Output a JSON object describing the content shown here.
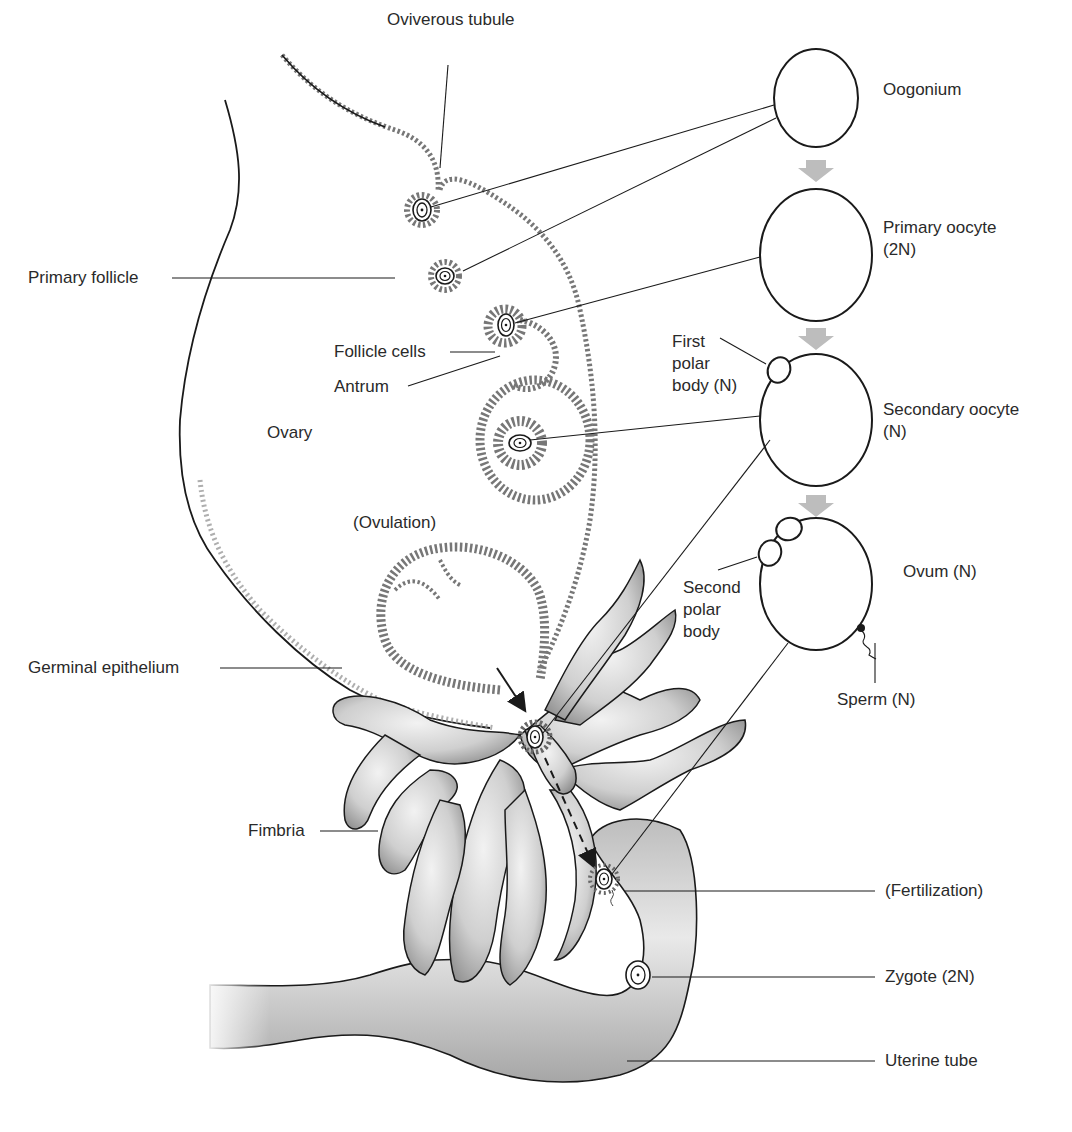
{
  "diagram": {
    "colors": {
      "line": "#1a1a1a",
      "tissue_fill": "#d4d4d4",
      "tissue_shade": "#a9a9a9",
      "arrow_gray": "#bdbdbd",
      "cell_outline": "#555555",
      "background": "#ffffff"
    }
  },
  "labels": {
    "oviverous_tubule": "Oviverous tubule",
    "primary_follicle": "Primary follicle",
    "follicle_cells": "Follicle cells",
    "antrum": "Antrum",
    "ovary": "Ovary",
    "ovulation": "(Ovulation)",
    "germinal_epithelium": "Germinal epithelium",
    "fimbria": "Fimbria",
    "fertilization": "(Fertilization)",
    "zygote": "Zygote (2N)",
    "uterine_tube": "Uterine tube"
  },
  "stages": [
    {
      "id": "oogonium",
      "label": "Oogonium",
      "label_line2": ""
    },
    {
      "id": "primary-oocyte",
      "label": "Primary oocyte",
      "label_line2": "(2N)"
    },
    {
      "id": "secondary-oocyte",
      "label": "Secondary oocyte",
      "label_line2": "(N)"
    },
    {
      "id": "ovum",
      "label": "Ovum (N)",
      "label_line2": ""
    }
  ],
  "stage_annotations": {
    "first_polar_body": [
      "First",
      "polar",
      "body (N)"
    ],
    "second_polar_body": [
      "Second",
      "polar",
      "body"
    ],
    "sperm": "Sperm (N)"
  }
}
